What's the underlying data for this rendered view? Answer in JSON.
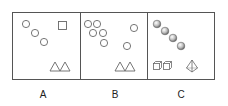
{
  "figure": {
    "stroke_color": "#555555",
    "panels": [
      {
        "label": "A",
        "contents": {
          "circles": 3,
          "squares": 1,
          "triangles": 2
        }
      },
      {
        "label": "B",
        "contents": {
          "circles": 7,
          "triangles": 2
        }
      },
      {
        "label": "C",
        "contents": {
          "spheres": 4,
          "cubes": 2,
          "pyramids": 1
        }
      }
    ]
  }
}
